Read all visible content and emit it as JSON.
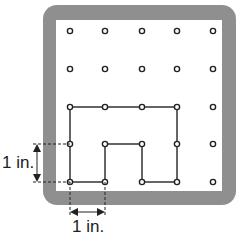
{
  "board": {
    "frame_color": "#8f8f8f",
    "grid_cols": 5,
    "grid_rows": 5,
    "col_x": [
      70,
      105,
      142,
      177,
      213
    ],
    "row_y": [
      31,
      69,
      107,
      144,
      182
    ]
  },
  "shape": {
    "description": "Rubber band outline forming an upside-down U shape",
    "vertices": [
      [
        0,
        2
      ],
      [
        3,
        2
      ],
      [
        3,
        4
      ],
      [
        2,
        4
      ],
      [
        2,
        3
      ],
      [
        1,
        3
      ],
      [
        1,
        4
      ],
      [
        0,
        4
      ]
    ]
  },
  "measures": {
    "vertical_label": "1 in.",
    "horizontal_label": "1 in."
  }
}
